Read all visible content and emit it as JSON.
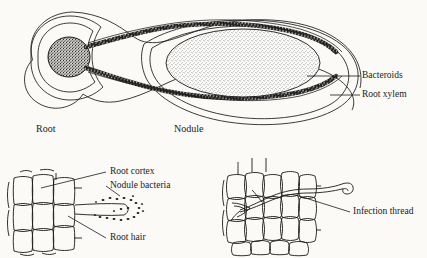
{
  "figure": {
    "type": "biology-diagram",
    "background_color": "#fbfaf7",
    "ink_color": "#1a1a1a"
  },
  "panels": {
    "top": {
      "name": "nodule-longitudinal-section",
      "labels": {
        "root": "Root",
        "nodule": "Nodule",
        "bacteroids": "Bacteroids",
        "root_xylem": "Root xylem"
      }
    },
    "bottom_left": {
      "name": "root-hair-infection-panel",
      "labels": {
        "root_cortex": "Root cortex",
        "nodule_bacteria": "Nodule bacteria",
        "root_hair": "Root hair"
      }
    },
    "bottom_right": {
      "name": "infection-thread-panel",
      "labels": {
        "infection_thread": "Infection thread"
      }
    }
  }
}
